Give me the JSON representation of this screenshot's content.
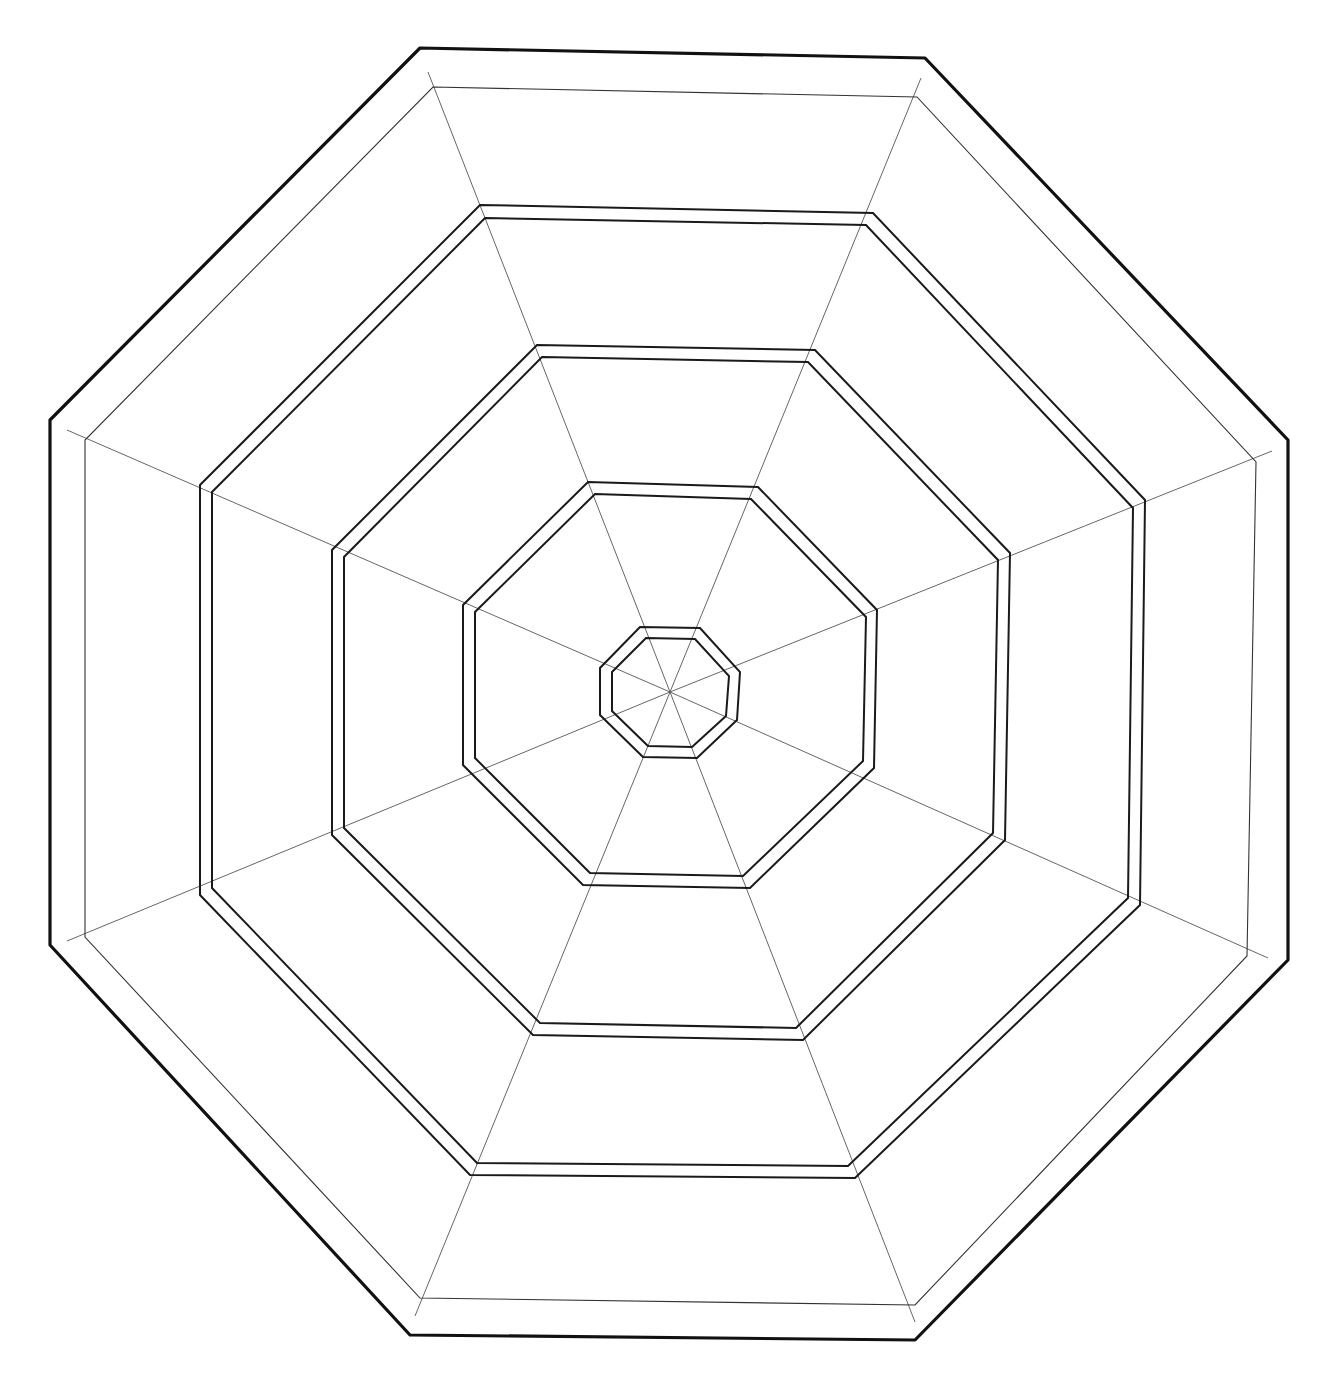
{
  "diagram": {
    "title": "",
    "shape": "octagon",
    "sides": 8,
    "radial_divisions": 8,
    "ring_count": 6,
    "rings": [
      {
        "name": "outer-boundary",
        "style": "thick",
        "lines": 1
      },
      {
        "name": "outer-thin-ring",
        "style": "thin",
        "lines": 1
      },
      {
        "name": "double-ring-1",
        "style": "double",
        "lines": 2
      },
      {
        "name": "double-ring-2",
        "style": "double",
        "lines": 2
      },
      {
        "name": "double-ring-3",
        "style": "double",
        "lines": 2
      },
      {
        "name": "double-ring-4",
        "style": "double",
        "lines": 2
      }
    ],
    "colors": {
      "background": "#ffffff",
      "line": "#111111",
      "spoke": "#555555"
    }
  }
}
